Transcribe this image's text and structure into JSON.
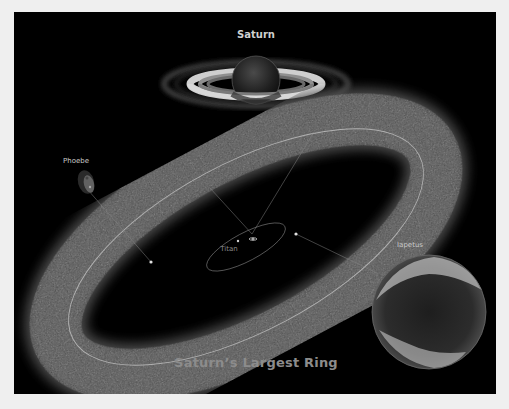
{
  "figure": {
    "title": "Saturn",
    "caption": "Saturn’s Largest Ring",
    "labels": {
      "phoebe": "Phoebe",
      "titan": "Titan",
      "iapetus": "Iapetus"
    },
    "colors": {
      "page_background": "#efefef",
      "panel_background": "#000000",
      "ring_haze": "#5a5a5a",
      "orbit_line": "#bdbdbd",
      "caption_text": "#8c8c8c"
    }
  }
}
